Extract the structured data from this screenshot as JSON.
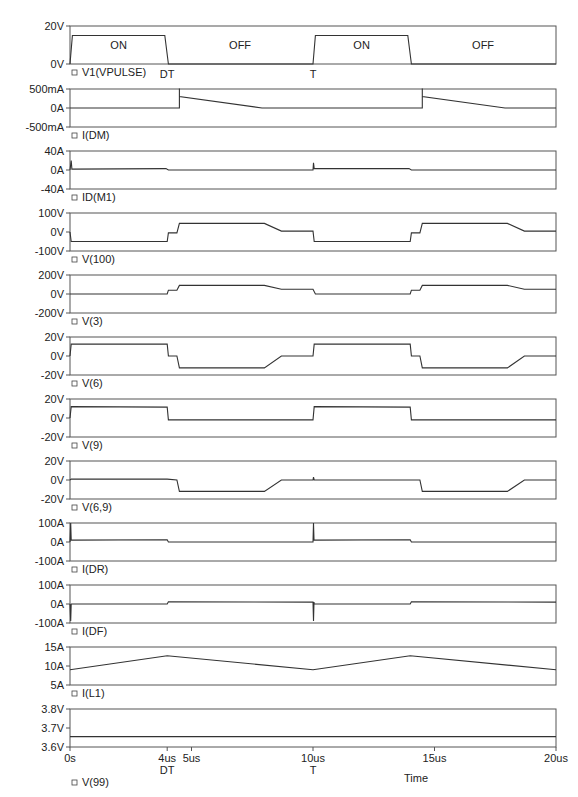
{
  "chart_data": {
    "type": "line",
    "title": "",
    "xlabel": "Time",
    "x_range": [
      0,
      20
    ],
    "x_unit": "us",
    "x_ticks": [
      {
        "value": 0,
        "label": "0s",
        "sublabel": ""
      },
      {
        "value": 4,
        "label": "4us",
        "sublabel": "DT"
      },
      {
        "value": 5,
        "label": "5us",
        "sublabel": ""
      },
      {
        "value": 10,
        "label": "10us",
        "sublabel": "T"
      },
      {
        "value": 15,
        "label": "15us",
        "sublabel": ""
      },
      {
        "value": 20,
        "label": "20us",
        "sublabel": ""
      }
    ],
    "grid": false,
    "panels": [
      {
        "trace": "V1(VPULSE)",
        "yticks": [
          "20V",
          "0V"
        ],
        "ylim": [
          0,
          20
        ],
        "annotations": [
          {
            "text": "ON",
            "x": 2
          },
          {
            "text": "OFF",
            "x": 7
          },
          {
            "text": "ON",
            "x": 12
          },
          {
            "text": "OFF",
            "x": 17
          }
        ],
        "below_labels": [
          {
            "text": "DT",
            "x": 4
          },
          {
            "text": "T",
            "x": 10
          }
        ],
        "points": [
          [
            0,
            0
          ],
          [
            0.1,
            15
          ],
          [
            3.9,
            15
          ],
          [
            4.05,
            0
          ],
          [
            10,
            0
          ],
          [
            10.1,
            15
          ],
          [
            13.9,
            15
          ],
          [
            14.05,
            0
          ],
          [
            20,
            0
          ]
        ]
      },
      {
        "trace": "I(DM)",
        "yticks": [
          "500mA",
          "0A",
          "-500mA"
        ],
        "ylim": [
          -500,
          500
        ],
        "points": [
          [
            0,
            0
          ],
          [
            4,
            0
          ],
          [
            4.5,
            0
          ],
          [
            4.5,
            510
          ],
          [
            4.5,
            300
          ],
          [
            7.9,
            0
          ],
          [
            10,
            0
          ],
          [
            14,
            0
          ],
          [
            14.5,
            0
          ],
          [
            14.5,
            510
          ],
          [
            14.5,
            300
          ],
          [
            17.9,
            0
          ],
          [
            20,
            0
          ]
        ]
      },
      {
        "trace": "ID(M1)",
        "yticks": [
          "40A",
          "0A",
          "-40A"
        ],
        "ylim": [
          -40,
          40
        ],
        "points": [
          [
            0,
            0
          ],
          [
            0.05,
            20
          ],
          [
            0.08,
            2
          ],
          [
            3.95,
            3
          ],
          [
            4.05,
            0
          ],
          [
            10,
            0
          ],
          [
            10.02,
            15
          ],
          [
            10.05,
            3
          ],
          [
            13.95,
            3
          ],
          [
            14.05,
            0
          ],
          [
            20,
            0
          ]
        ]
      },
      {
        "trace": "V(100)",
        "yticks": [
          "100V",
          "0V",
          "-100V"
        ],
        "ylim": [
          -100,
          100
        ],
        "points": [
          [
            0,
            0
          ],
          [
            0.05,
            -50
          ],
          [
            4,
            -50
          ],
          [
            4.05,
            -5
          ],
          [
            4.4,
            -5
          ],
          [
            4.5,
            45
          ],
          [
            8,
            45
          ],
          [
            8.7,
            5
          ],
          [
            10,
            5
          ],
          [
            10.05,
            -50
          ],
          [
            14,
            -50
          ],
          [
            14.05,
            -5
          ],
          [
            14.4,
            -5
          ],
          [
            14.5,
            45
          ],
          [
            18,
            45
          ],
          [
            18.7,
            5
          ],
          [
            20,
            5
          ]
        ]
      },
      {
        "trace": "V(3)",
        "yticks": [
          "200V",
          "0V",
          "-200V"
        ],
        "ylim": [
          -200,
          200
        ],
        "points": [
          [
            0,
            0
          ],
          [
            4,
            0
          ],
          [
            4.05,
            40
          ],
          [
            4.4,
            40
          ],
          [
            4.5,
            90
          ],
          [
            8,
            90
          ],
          [
            8.7,
            50
          ],
          [
            10,
            50
          ],
          [
            10.1,
            0
          ],
          [
            14,
            0
          ],
          [
            14.05,
            40
          ],
          [
            14.4,
            40
          ],
          [
            14.5,
            90
          ],
          [
            18,
            90
          ],
          [
            18.7,
            50
          ],
          [
            20,
            50
          ]
        ]
      },
      {
        "trace": "V(6)",
        "yticks": [
          "20V",
          "0V",
          "-20V"
        ],
        "ylim": [
          -20,
          20
        ],
        "points": [
          [
            0,
            0
          ],
          [
            0.05,
            12.5
          ],
          [
            4,
            12.5
          ],
          [
            4.05,
            0
          ],
          [
            4.4,
            0
          ],
          [
            4.5,
            -12.5
          ],
          [
            8,
            -12.5
          ],
          [
            8.7,
            0
          ],
          [
            10,
            0
          ],
          [
            10.05,
            12.5
          ],
          [
            14,
            12.5
          ],
          [
            14.05,
            0
          ],
          [
            14.4,
            0
          ],
          [
            14.5,
            -12.5
          ],
          [
            18,
            -12.5
          ],
          [
            18.7,
            0
          ],
          [
            20,
            0
          ]
        ]
      },
      {
        "trace": "V(9)",
        "yticks": [
          "20V",
          "0V",
          "-20V"
        ],
        "ylim": [
          -20,
          20
        ],
        "points": [
          [
            0,
            0
          ],
          [
            0.05,
            12
          ],
          [
            4,
            11.5
          ],
          [
            4.05,
            -2
          ],
          [
            10,
            -2
          ],
          [
            10.05,
            12
          ],
          [
            14,
            11.5
          ],
          [
            14.05,
            -2
          ],
          [
            20,
            -2
          ]
        ]
      },
      {
        "trace": "V(6,9)",
        "yticks": [
          "20V",
          "0V",
          "-20V"
        ],
        "ylim": [
          -20,
          20
        ],
        "points": [
          [
            0,
            0
          ],
          [
            0.05,
            1
          ],
          [
            4,
            1
          ],
          [
            4.4,
            0
          ],
          [
            4.5,
            -12
          ],
          [
            8,
            -12
          ],
          [
            8.7,
            0
          ],
          [
            10,
            0
          ],
          [
            10.02,
            3
          ],
          [
            10.05,
            0
          ],
          [
            14,
            0
          ],
          [
            14.4,
            0
          ],
          [
            14.5,
            -12
          ],
          [
            18,
            -12
          ],
          [
            18.7,
            0
          ],
          [
            20,
            0
          ]
        ]
      },
      {
        "trace": "I(DR)",
        "yticks": [
          "100A",
          "0A",
          "-100A"
        ],
        "ylim": [
          -100,
          100
        ],
        "points": [
          [
            0,
            0
          ],
          [
            0.03,
            100
          ],
          [
            0.05,
            10
          ],
          [
            4,
            12
          ],
          [
            4.05,
            0
          ],
          [
            10,
            0
          ],
          [
            10.02,
            100
          ],
          [
            10.04,
            10
          ],
          [
            14,
            12
          ],
          [
            14.05,
            0
          ],
          [
            20,
            0
          ]
        ]
      },
      {
        "trace": "I(DF)",
        "yticks": [
          "100A",
          "0A",
          "-100A"
        ],
        "ylim": [
          -100,
          100
        ],
        "points": [
          [
            0,
            0
          ],
          [
            0.03,
            -90
          ],
          [
            0.05,
            0
          ],
          [
            4,
            0
          ],
          [
            4.05,
            12
          ],
          [
            10,
            10
          ],
          [
            10.02,
            -90
          ],
          [
            10.04,
            10
          ],
          [
            10.05,
            0
          ],
          [
            14,
            0
          ],
          [
            14.05,
            12
          ],
          [
            20,
            10
          ]
        ]
      },
      {
        "trace": "I(L1)",
        "yticks": [
          "15A",
          "10A",
          "5A"
        ],
        "ylim": [
          5,
          15
        ],
        "points": [
          [
            0,
            9
          ],
          [
            4,
            12.7
          ],
          [
            10,
            9
          ],
          [
            14,
            12.7
          ],
          [
            20,
            9
          ]
        ]
      },
      {
        "trace": "V(99)",
        "yticks": [
          "3.8V",
          "3.7V",
          "3.6V"
        ],
        "ylim": [
          3.6,
          3.8
        ],
        "points": [
          [
            0,
            3.655
          ],
          [
            20,
            3.655
          ]
        ]
      }
    ]
  },
  "labels": {
    "x_axis_title": "Time"
  }
}
